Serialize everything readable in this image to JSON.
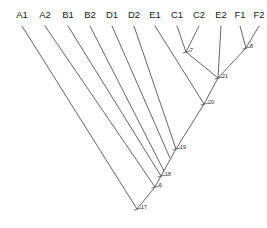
{
  "figure": {
    "type": "phylogenetic-tree",
    "width": 267,
    "height": 228,
    "background_color": "#ffffff",
    "line_color": "#555555",
    "text_color": "#1a1a1a"
  },
  "leaves": [
    {
      "label": "A1",
      "x": 22,
      "y": 18,
      "tip_x": 22,
      "tip_y": 26
    },
    {
      "label": "A2",
      "x": 45,
      "y": 18,
      "tip_x": 45,
      "tip_y": 26
    },
    {
      "label": "B1",
      "x": 68,
      "y": 18,
      "tip_x": 68,
      "tip_y": 26
    },
    {
      "label": "B2",
      "x": 90,
      "y": 18,
      "tip_x": 90,
      "tip_y": 26
    },
    {
      "label": "D1",
      "x": 112,
      "y": 18,
      "tip_x": 112,
      "tip_y": 26
    },
    {
      "label": "D2",
      "x": 134,
      "y": 18,
      "tip_x": 134,
      "tip_y": 26
    },
    {
      "label": "E1",
      "x": 155,
      "y": 18,
      "tip_x": 155,
      "tip_y": 26
    },
    {
      "label": "C1",
      "x": 177,
      "y": 18,
      "tip_x": 177,
      "tip_y": 26
    },
    {
      "label": "C2",
      "x": 199,
      "y": 18,
      "tip_x": 199,
      "tip_y": 26
    },
    {
      "label": "E2",
      "x": 221,
      "y": 18,
      "tip_x": 221,
      "tip_y": 26
    },
    {
      "label": "F1",
      "x": 240,
      "y": 18,
      "tip_x": 240,
      "tip_y": 26
    },
    {
      "label": "F2",
      "x": 259,
      "y": 18,
      "tip_x": 259,
      "tip_y": 26
    }
  ],
  "internal_nodes": [
    {
      "label": "7",
      "x": 186,
      "y": 52,
      "label_x": 190,
      "label_y": 51
    },
    {
      "label": "8",
      "x": 246,
      "y": 48,
      "label_x": 250,
      "label_y": 47
    },
    {
      "label": "21",
      "x": 218,
      "y": 78,
      "label_x": 222,
      "label_y": 77
    },
    {
      "label": "20",
      "x": 204,
      "y": 104,
      "label_x": 208,
      "label_y": 103
    },
    {
      "label": "19",
      "x": 176,
      "y": 149,
      "label_x": 180,
      "label_y": 148
    },
    {
      "label": "18",
      "x": 161,
      "y": 176,
      "label_x": 165,
      "label_y": 175
    },
    {
      "label": "6",
      "x": 155,
      "y": 187,
      "label_x": 159,
      "label_y": 186
    },
    {
      "label": "17",
      "x": 137,
      "y": 209,
      "label_x": 141,
      "label_y": 208
    }
  ],
  "branches": [
    {
      "name": "A1-to-root",
      "x1": 22,
      "y1": 26,
      "x2": 137,
      "y2": 209
    },
    {
      "name": "A2-to-n6",
      "x1": 45,
      "y1": 26,
      "x2": 155,
      "y2": 187
    },
    {
      "name": "B1-to-n18",
      "x1": 68,
      "y1": 26,
      "x2": 161,
      "y2": 176
    },
    {
      "name": "B2-to-n18",
      "x1": 90,
      "y1": 26,
      "x2": 164,
      "y2": 171
    },
    {
      "name": "D1-to-n19",
      "x1": 112,
      "y1": 26,
      "x2": 170,
      "y2": 158
    },
    {
      "name": "D2-to-n19",
      "x1": 134,
      "y1": 26,
      "x2": 176,
      "y2": 149
    },
    {
      "name": "E1-to-n20",
      "x1": 155,
      "y1": 26,
      "x2": 204,
      "y2": 104
    },
    {
      "name": "C1-to-n7",
      "x1": 177,
      "y1": 26,
      "x2": 186,
      "y2": 52
    },
    {
      "name": "C2-to-n7",
      "x1": 199,
      "y1": 26,
      "x2": 186,
      "y2": 52
    },
    {
      "name": "n7-to-n21",
      "x1": 186,
      "y1": 52,
      "x2": 218,
      "y2": 78
    },
    {
      "name": "E2-to-n21",
      "x1": 221,
      "y1": 26,
      "x2": 218,
      "y2": 78
    },
    {
      "name": "F1-to-n8",
      "x1": 240,
      "y1": 26,
      "x2": 246,
      "y2": 48
    },
    {
      "name": "F2-to-n8",
      "x1": 259,
      "y1": 26,
      "x2": 246,
      "y2": 48
    },
    {
      "name": "n8-to-n21",
      "x1": 246,
      "y1": 48,
      "x2": 218,
      "y2": 78
    },
    {
      "name": "n21-to-n20",
      "x1": 218,
      "y1": 78,
      "x2": 204,
      "y2": 104
    },
    {
      "name": "n20-to-n19",
      "x1": 204,
      "y1": 104,
      "x2": 176,
      "y2": 149
    },
    {
      "name": "n19-to-n18",
      "x1": 176,
      "y1": 149,
      "x2": 161,
      "y2": 176
    },
    {
      "name": "n18-to-n6",
      "x1": 161,
      "y1": 176,
      "x2": 155,
      "y2": 187
    },
    {
      "name": "n6-to-root",
      "x1": 155,
      "y1": 187,
      "x2": 137,
      "y2": 209
    }
  ],
  "node_ticks": [
    {
      "name": "tick-7",
      "x1": 183,
      "y1": 53,
      "x2": 190,
      "y2": 51
    },
    {
      "name": "tick-8",
      "x1": 243,
      "y1": 49,
      "x2": 250,
      "y2": 47
    },
    {
      "name": "tick-21",
      "x1": 215,
      "y1": 79,
      "x2": 222,
      "y2": 77
    },
    {
      "name": "tick-20",
      "x1": 201,
      "y1": 105,
      "x2": 208,
      "y2": 103
    },
    {
      "name": "tick-19",
      "x1": 173,
      "y1": 150,
      "x2": 180,
      "y2": 148
    },
    {
      "name": "tick-18",
      "x1": 158,
      "y1": 177,
      "x2": 165,
      "y2": 175
    },
    {
      "name": "tick-6",
      "x1": 152,
      "y1": 188,
      "x2": 159,
      "y2": 186
    },
    {
      "name": "tick-17",
      "x1": 134,
      "y1": 210,
      "x2": 141,
      "y2": 208
    }
  ]
}
